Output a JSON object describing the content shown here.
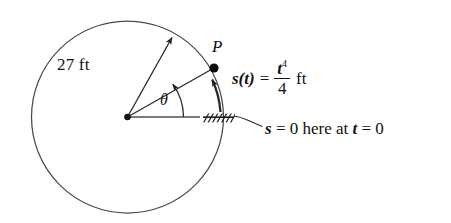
{
  "figure": {
    "background_color": "#ffffff",
    "stroke_color": "#3a3a3a",
    "ink_color": "#111111"
  },
  "labels": {
    "radius": "27 ft",
    "point": "P",
    "angle": "θ",
    "arclength_lhs": "s(t)",
    "equals": "=",
    "arclength_numerator": "t",
    "arclength_exponent": "4",
    "arclength_denominator": "4",
    "arclength_units": "ft",
    "datum_note_part1": "s",
    "datum_note_part2": " = 0 here at ",
    "datum_note_part3": "t",
    "datum_note_part4": " = 0"
  },
  "geometry": {
    "circle_center_x": 127.5,
    "circle_center_y": 117,
    "circle_radius": 96,
    "point_p_x": 214,
    "point_p_y": 68,
    "radius_arrow_tip_x": 173,
    "radius_arrow_tip_y": 36,
    "baseline_end_x": 200,
    "baseline_end_y": 117,
    "hatch_x": 203,
    "hatch_y": 121
  }
}
